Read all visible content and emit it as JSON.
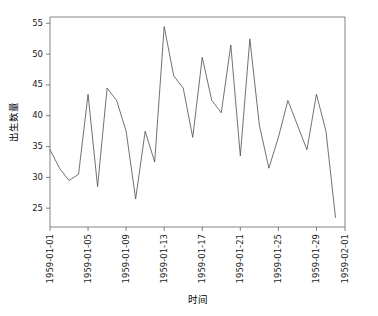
{
  "chart_data": {
    "type": "line",
    "title": "",
    "subtitle": "",
    "xlabel": "时间",
    "ylabel": "出生数量",
    "x": [
      "1959-01-01",
      "1959-01-02",
      "1959-01-03",
      "1959-01-04",
      "1959-01-05",
      "1959-01-06",
      "1959-01-07",
      "1959-01-08",
      "1959-01-09",
      "1959-01-10",
      "1959-01-11",
      "1959-01-12",
      "1959-01-13",
      "1959-01-14",
      "1959-01-15",
      "1959-01-16",
      "1959-01-17",
      "1959-01-18",
      "1959-01-19",
      "1959-01-20",
      "1959-01-21",
      "1959-01-22",
      "1959-01-23",
      "1959-01-24",
      "1959-01-25",
      "1959-01-26",
      "1959-01-27",
      "1959-01-28",
      "1959-01-29",
      "1959-01-30",
      "1959-01-31"
    ],
    "values": [
      35,
      32,
      30,
      31,
      44,
      29,
      45,
      43,
      38,
      27,
      38,
      33,
      55,
      47,
      45,
      37,
      50,
      43,
      41,
      52,
      34,
      53,
      39,
      32,
      37,
      43,
      39,
      35,
      44,
      38,
      24
    ],
    "series": [
      {
        "name": "出生数量",
        "color": "#4d4d4d",
        "values": [
          35,
          32,
          30,
          31,
          44,
          29,
          45,
          43,
          38,
          27,
          38,
          33,
          55,
          47,
          45,
          37,
          50,
          43,
          41,
          52,
          34,
          53,
          39,
          32,
          37,
          43,
          39,
          35,
          44,
          38,
          24
        ]
      }
    ],
    "xlim": [
      0,
      31
    ],
    "ylim": [
      22.45,
      56.55
    ],
    "yticks": [
      25,
      30,
      35,
      40,
      45,
      50,
      55
    ],
    "ytick_labels": [
      "25",
      "30",
      "35",
      "40",
      "45",
      "50",
      "55"
    ],
    "xticks": [
      0,
      4,
      8,
      12,
      16,
      20,
      24,
      28,
      31
    ],
    "xtick_labels": [
      "1959-01-01",
      "1959-01-05",
      "1959-01-09",
      "1959-01-13",
      "1959-01-17",
      "1959-01-21",
      "1959-01-25",
      "1959-01-29",
      "1959-02-01"
    ],
    "grid": false,
    "legend": false,
    "legend_position": "none",
    "line_width": 0.8,
    "markers": false,
    "xtick_rotation": 90
  },
  "figure": {
    "background_color": "#ffffff",
    "axes_color": "#4d4d4d",
    "text_color": "#1a1a1a",
    "line_color": "#4d4d4d"
  }
}
